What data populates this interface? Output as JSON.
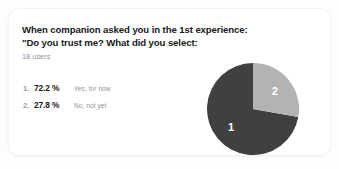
{
  "card": {
    "title_line1": "When companion asked you in the 1st experience:",
    "title_line2": "\"Do you trust me? What did you select:",
    "subtitle": "18 users"
  },
  "results": [
    {
      "rank": "1.",
      "percent": "72.2 %",
      "answer": "Yes, for now"
    },
    {
      "rank": "2.",
      "percent": "27.8 %",
      "answer": "No, not yet"
    }
  ],
  "chart_data": {
    "type": "pie",
    "title": "When companion asked you in the 1st experience: \"Do you trust me? What did you select:",
    "subtitle": "18 users",
    "categories": [
      "Yes, for now",
      "No, not yet"
    ],
    "values": [
      72.2,
      27.8
    ],
    "value_unit": "%",
    "slice_labels": [
      "1",
      "2"
    ],
    "colors": [
      "#404040",
      "#b3b3b3"
    ],
    "label_color": "#ffffff",
    "start_angle_deg": 0,
    "direction": "counterclockwise",
    "legend": "inline-list",
    "grid": false,
    "total_users": 18
  },
  "colors": {
    "page_background": "#fdfdfd",
    "card_background": "#ffffff",
    "title_text": "#17181a",
    "muted_text": "#8d9094",
    "slice_primary": "#404040",
    "slice_secondary": "#b3b3b3"
  }
}
